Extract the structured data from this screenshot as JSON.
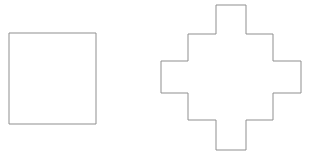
{
  "canvas": {
    "width": 319,
    "height": 160,
    "background_color": "#ffffff",
    "stroke_color": "#8f8f8f",
    "stroke_width": 1,
    "fill_color": "#ffffff"
  },
  "figure": {
    "title": "",
    "shape_count": 2
  },
  "shapes": [
    {
      "id": "square",
      "name": "square",
      "kind": "rectangle",
      "label": "Square",
      "x": 9,
      "y": 33,
      "width": 87,
      "height": 91,
      "points": "9,33 96,33 96,124 9,124",
      "vertex_count": 4,
      "stroke_color": "#8f8f8f",
      "fill_color": "#ffffff"
    },
    {
      "id": "stepped-cross",
      "name": "stepped-cross",
      "kind": "polygon",
      "label": "Stepped Cross",
      "x": 161,
      "y": 5,
      "width": 140,
      "height": 145,
      "points": "216,5 246,5 246,34 273,34 273,61 301,61 301,93 273,93 273,120 246,120 246,150 216,150 216,120 188,120 188,93 161,93 161,61 188,61 188,34 216,34",
      "vertex_count": 20,
      "stroke_color": "#8f8f8f",
      "fill_color": "#ffffff"
    }
  ]
}
